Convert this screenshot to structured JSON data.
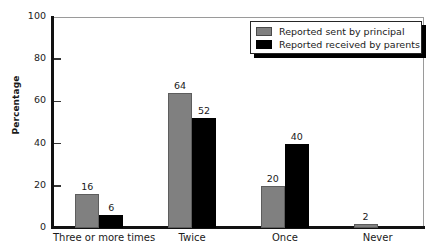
{
  "chart_data": {
    "type": "bar",
    "title": "",
    "xlabel": "",
    "ylabel": "Percentage",
    "ylim": [
      0,
      100
    ],
    "ytick_step": 20,
    "yticks": [
      0,
      20,
      40,
      60,
      80,
      100
    ],
    "ytick_labels": [
      "0",
      "20",
      "40",
      "60",
      "80",
      "100"
    ],
    "grid": false,
    "legend_position": "top-right",
    "categories": [
      "Three or more times",
      "Twice",
      "Once",
      "Never"
    ],
    "series": [
      {
        "name": "Reported sent by principal",
        "color": "#808080",
        "values": [
          16,
          64,
          20,
          2
        ],
        "labels": [
          "16",
          "64",
          "20",
          "2"
        ]
      },
      {
        "name": "Reported received by parents",
        "color": "#000000",
        "values": [
          6,
          52,
          40,
          0
        ],
        "labels": [
          "6",
          "52",
          "40",
          ""
        ]
      }
    ]
  },
  "legend": {
    "items": [
      {
        "label": "Reported sent by principal",
        "swatch": "gray-swatch"
      },
      {
        "label": "Reported received by parents",
        "swatch": "black-swatch"
      }
    ]
  },
  "axes": {
    "y_title": "Percentage",
    "y_tick_labels": [
      "100",
      "80",
      "60",
      "40",
      "20",
      "0"
    ],
    "x_tick_labels": [
      "Three or more times",
      "Twice",
      "Once",
      "Never"
    ]
  },
  "colors": {
    "series_sent": "#808080",
    "series_received": "#000000",
    "axis": "#111111",
    "frame": "#9a9a9a",
    "background": "#ffffff"
  }
}
